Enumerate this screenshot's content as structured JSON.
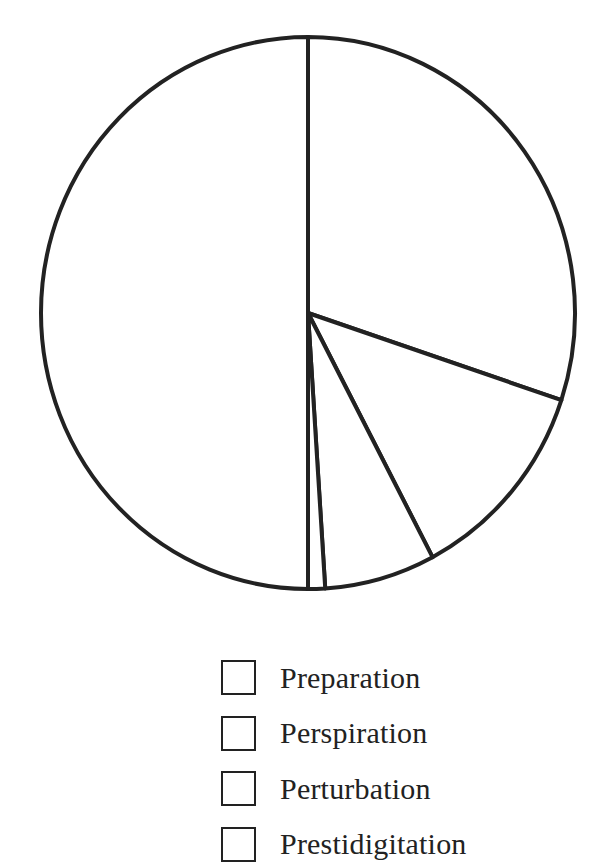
{
  "chart_data": {
    "type": "pie",
    "title": "",
    "start_angle_deg": 0,
    "direction": "clockwise",
    "slices": [
      {
        "index": 0,
        "percent": 30.1,
        "angle_deg": 108.4,
        "fill": "#ffffff"
      },
      {
        "index": 1,
        "percent": 12.2,
        "angle_deg": 43.8,
        "fill": "#ffffff"
      },
      {
        "index": 2,
        "percent": 6.7,
        "angle_deg": 24.1,
        "fill": "#ffffff"
      },
      {
        "index": 3,
        "percent": 1.0,
        "angle_deg": 3.7,
        "fill": "#ffffff"
      },
      {
        "index": 4,
        "percent": 50.0,
        "angle_deg": 180.0,
        "fill": "#ffffff"
      }
    ],
    "values": [
      30.1,
      12.2,
      6.7,
      1.0,
      50.0
    ],
    "legend": {
      "position": "bottom-center",
      "entries": [
        "Preparation",
        "Perspiration",
        "Perturbation",
        "Prestidigitation"
      ]
    },
    "stroke_color": "#222222",
    "background": "#ffffff"
  },
  "legend": {
    "items": [
      {
        "label": "Preparation"
      },
      {
        "label": "Perspiration"
      },
      {
        "label": "Perturbation"
      },
      {
        "label": "Prestidigitation"
      }
    ]
  }
}
